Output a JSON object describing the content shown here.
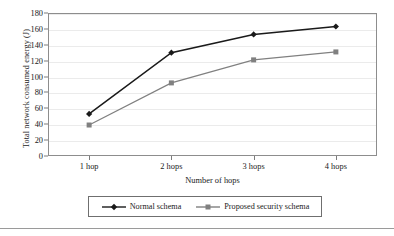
{
  "chart_data": {
    "type": "line",
    "title": "",
    "xlabel": "Number of hops",
    "ylabel": "Total network consumed energy (J)",
    "categories": [
      "1 hop",
      "2 hops",
      "3 hops",
      "4 hops"
    ],
    "ylim": [
      0,
      180
    ],
    "ytick_labels": [
      "0",
      "20",
      "40",
      "60",
      "80",
      "100",
      "120",
      "140",
      "160",
      "180"
    ],
    "ytick_values": [
      0,
      20,
      40,
      60,
      80,
      100,
      120,
      140,
      160,
      180
    ],
    "grid": true,
    "legend_position": "bottom",
    "series": [
      {
        "name": "Normal schema",
        "values": [
          53,
          130,
          153,
          163
        ],
        "color": "#1a1a1a",
        "marker": "diamond"
      },
      {
        "name": "Proposed security schema",
        "values": [
          39,
          92,
          121,
          131
        ],
        "color": "#808080",
        "marker": "square"
      }
    ]
  },
  "legend": {
    "items": [
      {
        "label": "Normal schema",
        "marker": "diamond-marker-icon",
        "color": "#1a1a1a"
      },
      {
        "label": "Proposed security schema",
        "marker": "square-marker-icon",
        "color": "#808080"
      }
    ]
  },
  "colors": {
    "series_primary": "#1a1a1a",
    "series_secondary": "#808080",
    "gridline": "#ebebeb",
    "plot_border": "#8d8d8d",
    "page_rule": "#9a9a9a"
  }
}
